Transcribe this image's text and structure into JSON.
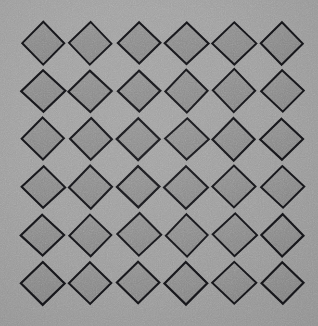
{
  "scene": {
    "title": "Diamond Grid Pattern",
    "description": "Flat overhead photograph of a regular grid of outlined diamond shapes on a gray surface",
    "width": 318,
    "height": 326,
    "background_color": "#9e9e9e",
    "grain": true,
    "grain_opacity": 0.4
  },
  "pattern": {
    "name": "diamond-lattice",
    "shape": "diamond",
    "rows": 6,
    "columns": 6,
    "count": 36,
    "fill_color": "#8b8b8b",
    "stroke_color": "#16161a",
    "stroke_width": 2.1,
    "half_width": 21.5,
    "half_height": 21.0,
    "origin_x": 43,
    "origin_y": 43,
    "step_x": 47.8,
    "step_y": 48.0,
    "corner_radius": 1.5
  },
  "palette": {
    "background": "#9e9e9e",
    "diamond_fill": "#8b8b8b",
    "diamond_stroke": "#16161a",
    "highlight": "#a9a9a9",
    "shadow": "#7c7c7c"
  }
}
